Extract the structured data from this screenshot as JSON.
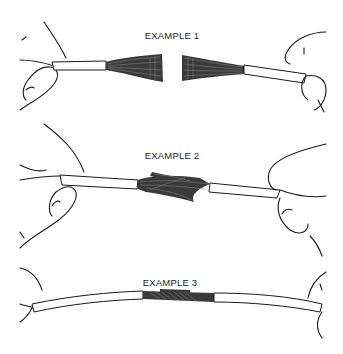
{
  "figure": {
    "examples": [
      {
        "label": "EXAMPLE 1",
        "description": "Two stripped wires with fanned strands held apart by hands"
      },
      {
        "label": "EXAMPLE 2",
        "description": "Strands of both wires interlaced together"
      },
      {
        "label": "EXAMPLE 3",
        "description": "Strands twisted tight forming finished splice"
      }
    ]
  },
  "colors": {
    "background": "#ffffff",
    "ink": "#1a1a1a"
  }
}
